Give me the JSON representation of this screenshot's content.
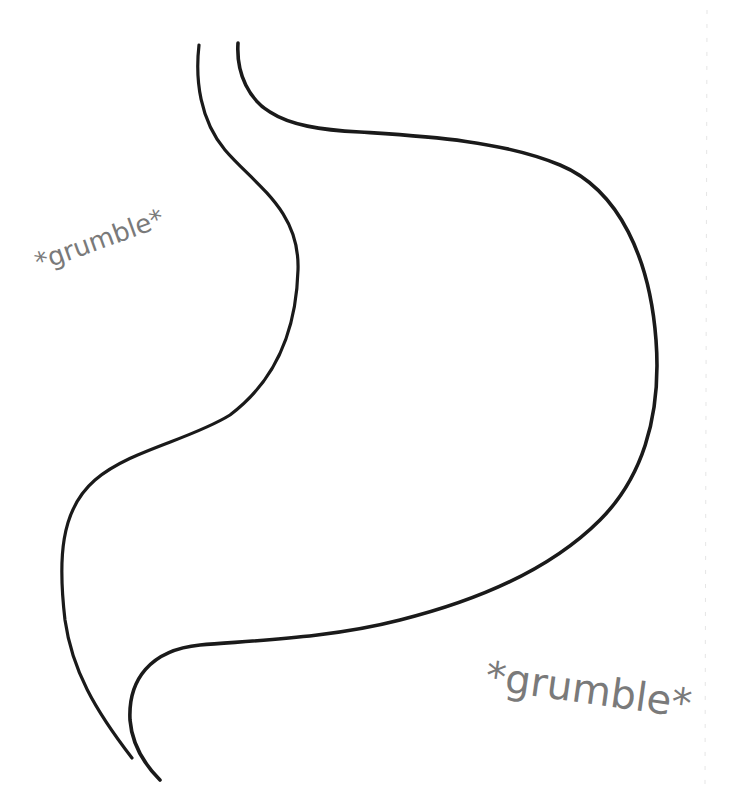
{
  "illustration": {
    "subject": "stomach-outline",
    "stroke_color": "#1a1a1a",
    "background_color": "#ffffff"
  },
  "labels": {
    "left": "*grumble*",
    "right": "*grumble*"
  },
  "label_color": "#7a7a7a"
}
